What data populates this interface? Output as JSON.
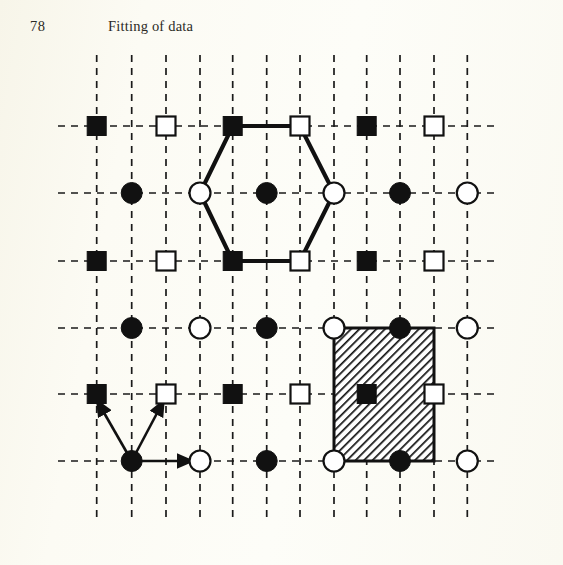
{
  "page": {
    "number": "78",
    "running_head": "Fitting of data",
    "background_color": "#fbfaf2",
    "ink_color": "#111111",
    "width": 563,
    "height": 565
  },
  "figure": {
    "name": "hexagonal-lattice-diagram",
    "grid": {
      "columns_x": [
        96.7,
        131.7,
        166.0,
        200.0,
        232.7,
        266.7,
        300.0,
        334.0,
        366.7,
        400.0,
        434.0,
        467.3
      ],
      "rows_y": [
        126.0,
        193.0,
        261.0,
        328.0,
        394.0,
        461.0
      ],
      "vertical_line_top": 55,
      "vertical_line_bottom": 522,
      "horizontal_line_left": 58,
      "horizontal_line_right": 500,
      "dash_pattern": "7 6",
      "line_width": 1.7,
      "line_color": "#1a1a1a"
    },
    "rows": [
      {
        "index": 1,
        "y": 126.0,
        "marker": "square",
        "columns": [
          1,
          3,
          5,
          7,
          9,
          11
        ],
        "fills": [
          "filled",
          "open",
          "filled",
          "open",
          "filled",
          "open"
        ]
      },
      {
        "index": 2,
        "y": 193.0,
        "marker": "circle",
        "columns": [
          2,
          4,
          6,
          8,
          10,
          12
        ],
        "fills": [
          "filled",
          "open",
          "filled",
          "open",
          "filled",
          "open"
        ]
      },
      {
        "index": 3,
        "y": 261.0,
        "marker": "square",
        "columns": [
          1,
          3,
          5,
          7,
          9,
          11
        ],
        "fills": [
          "filled",
          "open",
          "filled",
          "open",
          "filled",
          "open"
        ]
      },
      {
        "index": 4,
        "y": 328.0,
        "marker": "circle",
        "columns": [
          2,
          4,
          6,
          8,
          10,
          12
        ],
        "fills": [
          "filled",
          "open",
          "filled",
          "open",
          "filled",
          "open"
        ]
      },
      {
        "index": 5,
        "y": 394.0,
        "marker": "square",
        "columns": [
          1,
          3,
          5,
          7,
          9,
          11
        ],
        "fills": [
          "filled",
          "open",
          "filled",
          "open",
          "filled",
          "open"
        ]
      },
      {
        "index": 6,
        "y": 461.0,
        "marker": "circle",
        "columns": [
          2,
          4,
          6,
          8,
          10,
          12
        ],
        "fills": [
          "filled",
          "open",
          "filled",
          "open",
          "filled",
          "open"
        ]
      }
    ],
    "marker_sizes": {
      "square_side": 19,
      "circle_radius": 10.5,
      "center_square_side": 17
    },
    "hexagon": {
      "stroke_width": 4.2,
      "vertices": [
        {
          "x": 232.7,
          "y": 126.0,
          "site": "filled-square"
        },
        {
          "x": 300.0,
          "y": 126.0,
          "site": "open-square"
        },
        {
          "x": 334.0,
          "y": 193.0,
          "site": "open-circle"
        },
        {
          "x": 300.0,
          "y": 261.0,
          "site": "open-square"
        },
        {
          "x": 232.7,
          "y": 261.0,
          "site": "filled-square"
        },
        {
          "x": 200.0,
          "y": 193.0,
          "site": "open-circle"
        }
      ]
    },
    "unit_cell": {
      "x": 334.0,
      "y": 328.0,
      "width": 100.0,
      "height": 133.0,
      "hatch": "diagonal",
      "hatch_angle_deg": 45,
      "border_width": 3,
      "center_marker": {
        "x": 366.7,
        "y": 394.0,
        "site": "filled-square"
      }
    },
    "arrows": {
      "origin": {
        "x": 131.7,
        "y": 461.0,
        "site": "filled-circle"
      },
      "vectors": [
        {
          "name": "arrow-up-left",
          "to_x": 96.7,
          "to_y": 400.0,
          "target_site": "filled-square"
        },
        {
          "name": "arrow-up-right",
          "to_x": 164.0,
          "to_y": 400.0,
          "target_site": "open-square"
        },
        {
          "name": "arrow-right",
          "to_x": 193.0,
          "to_y": 461.0,
          "target_site": "open-circle"
        }
      ],
      "stroke_width": 2.6
    }
  }
}
